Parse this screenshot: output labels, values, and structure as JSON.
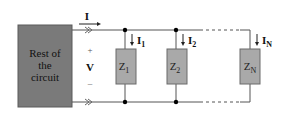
{
  "diagram": {
    "type": "parallel-impedance-circuit",
    "source_block": {
      "label_lines": [
        "Rest of",
        "the",
        "circuit"
      ],
      "fill": "#7a7a7a"
    },
    "total_current": {
      "label": "I"
    },
    "voltage": {
      "plus": "+",
      "label": "V",
      "minus": "–"
    },
    "branches": [
      {
        "impedance": "Z",
        "impedance_sub": "1",
        "current": "I",
        "current_sub": "1"
      },
      {
        "impedance": "Z",
        "impedance_sub": "2",
        "current": "I",
        "current_sub": "2"
      },
      {
        "impedance": "Z",
        "impedance_sub": "N",
        "current": "I",
        "current_sub": "N"
      }
    ],
    "colors": {
      "wire": "#555555",
      "impedance_fill": "#a9a9a9",
      "impedance_stroke": "#6a6a6a",
      "node": "#000000",
      "text": "#111111"
    }
  }
}
